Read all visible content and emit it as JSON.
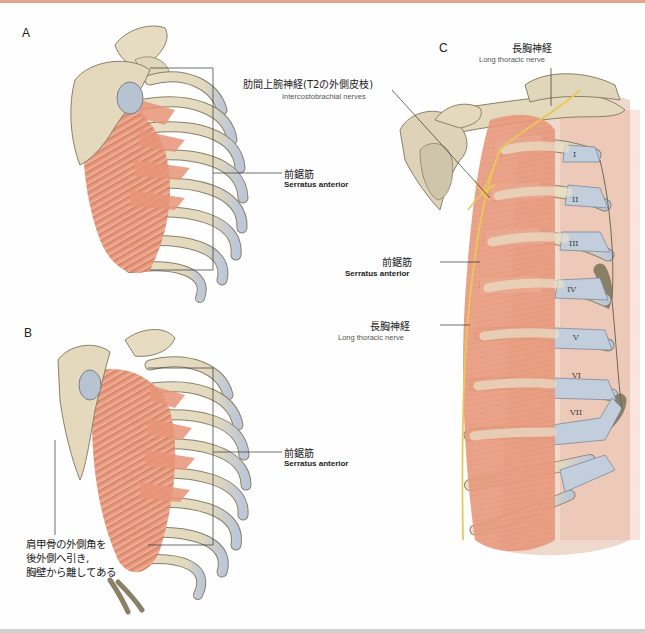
{
  "figure": {
    "top_rule_color": "#e1a58f",
    "bottom_rule_color": "#cfcfcf",
    "colors": {
      "bone": "#e6dcc2",
      "bone_outline": "#8a8068",
      "cartilage": "#c3cedd",
      "muscle": "#e08a6c",
      "muscle_light": "#efb39c",
      "nerve": "#e8c85a",
      "leader_line": "#333333"
    },
    "panels": [
      {
        "id": "A",
        "letter": "A",
        "labels": [
          {
            "jp": "前鋸筋",
            "en": "Serratus anterior"
          }
        ]
      },
      {
        "id": "B",
        "letter": "B",
        "labels": [
          {
            "jp": "前鋸筋",
            "en": "Serratus anterior"
          }
        ],
        "note_lines": [
          "肩甲骨の外側角を",
          "後外側へ引き,",
          "胸壁から離してある"
        ]
      },
      {
        "id": "C",
        "letter": "C",
        "labels": [
          {
            "jp": "長胸神経",
            "en": "Long thoracic nerve"
          },
          {
            "jp": "肋間上腕神経(T2の外側皮枝)",
            "en": "Intercostobrachial nerves"
          },
          {
            "jp": "前鋸筋",
            "en": "Serratus anterior"
          },
          {
            "jp": "長胸神経",
            "en": "Long thoracic nerve"
          }
        ],
        "rib_numerals": [
          "I",
          "II",
          "III",
          "IV",
          "V",
          "VI",
          "VII"
        ]
      }
    ]
  }
}
